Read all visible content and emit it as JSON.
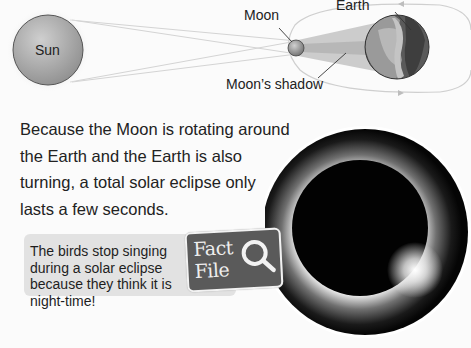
{
  "diagram": {
    "labels": {
      "sun": "Sun",
      "moon": "Moon",
      "earth": "Earth",
      "moon_shadow": "Moon’s shadow"
    },
    "colors": {
      "sun": "#a9a9a9",
      "moon": "#9a9a9a",
      "earth_dark": "#4e4e4e",
      "earth_light": "#8c8c8c",
      "shadow_cone": "#c4c4c4",
      "orbit": "#cfcfcf"
    }
  },
  "main_text": "Because the Moon is rotating around the Earth and the Earth is also turning, a total solar eclipse only lasts a few seconds.",
  "fact_file": {
    "badge_line1": "Fact",
    "badge_line2": "File",
    "icon": "magnifier-icon",
    "text": "The birds stop singing during a solar eclipse because they think it is night-time!",
    "colors": {
      "box": "#e2e2e2",
      "badge": "#5a5a5a"
    }
  },
  "photo": {
    "subject": "total solar eclipse with corona"
  }
}
